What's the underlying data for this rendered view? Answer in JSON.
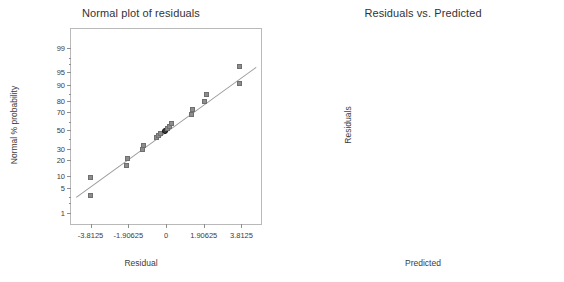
{
  "chart_data": [
    {
      "type": "scatter",
      "id": "normal-plot-of-residuals",
      "title": "Normal plot of residuals",
      "xlabel": "Residual",
      "ylabel": "Normal % probability",
      "grid": false,
      "legend": "none",
      "xlim": [
        -4.8,
        4.8
      ],
      "xticks": [
        "-3.8125",
        "-1.90625",
        "0",
        "1.90625",
        "3.8125"
      ],
      "xtickvals": [
        -3.8125,
        -1.90625,
        0,
        1.90625,
        3.8125
      ],
      "yticks": [
        "99",
        "95",
        "90",
        "80",
        "70",
        "50",
        "30",
        "20",
        "10",
        "5",
        "1"
      ],
      "ytickvals": [
        99,
        95,
        90,
        80,
        70,
        50,
        30,
        20,
        10,
        5,
        1
      ],
      "ylim": [
        0.4,
        99.8
      ],
      "reference_line": {
        "x1": -4.55,
        "y1": 3.0,
        "x2": 4.55,
        "y2": 96.5
      },
      "points": [
        {
          "x": -3.8,
          "y": 9.1,
          "highlight": false
        },
        {
          "x": -3.78,
          "y": 3.2,
          "highlight": false
        },
        {
          "x": -1.95,
          "y": 15.5,
          "highlight": false
        },
        {
          "x": -1.9,
          "y": 21.0,
          "highlight": false
        },
        {
          "x": -1.16,
          "y": 29.0,
          "highlight": false
        },
        {
          "x": -1.1,
          "y": 32.5,
          "highlight": false
        },
        {
          "x": -0.46,
          "y": 41.5,
          "highlight": false
        },
        {
          "x": -0.35,
          "y": 44.0,
          "highlight": false
        },
        {
          "x": -0.27,
          "y": 46.0,
          "highlight": false
        },
        {
          "x": -0.05,
          "y": 49.0,
          "highlight": true
        },
        {
          "x": 0.12,
          "y": 51.5,
          "highlight": false
        },
        {
          "x": 0.22,
          "y": 54.0,
          "highlight": false
        },
        {
          "x": 0.3,
          "y": 57.0,
          "highlight": false
        },
        {
          "x": 1.3,
          "y": 66.5,
          "highlight": false
        },
        {
          "x": 1.35,
          "y": 71.5,
          "highlight": false
        },
        {
          "x": 1.98,
          "y": 79.0,
          "highlight": false
        },
        {
          "x": 2.05,
          "y": 84.0,
          "highlight": false
        },
        {
          "x": 3.72,
          "y": 96.5,
          "highlight": false
        },
        {
          "x": 3.74,
          "y": 90.5,
          "highlight": false
        }
      ]
    },
    {
      "type": "scatter",
      "id": "residuals-vs-predicted",
      "title": "Residuals vs. Predicted",
      "xlabel": "Predicted",
      "ylabel": "Residuals",
      "grid": false,
      "legend": "none",
      "xlim": [
        -9.0,
        60.2
      ],
      "xticks": [
        "-3.81",
        "10.81",
        "25.44",
        "40.06",
        "54.69"
      ],
      "xtickvals": [
        -3.81,
        10.81,
        25.44,
        40.06,
        54.69
      ],
      "yticks": [
        "3.8125",
        "1.90625",
        "0",
        "-1.90625",
        "-3.8125"
      ],
      "ytickvals": [
        3.8125,
        1.90625,
        0,
        -1.90625,
        -3.8125
      ],
      "ylim": [
        -4.65,
        4.62
      ],
      "zero_reference_line": 0,
      "points": [
        {
          "x": -4.3,
          "y": 3.78
        },
        {
          "x": 4.3,
          "y": 3.62
        },
        {
          "x": 0.6,
          "y": 1.94
        },
        {
          "x": 3.2,
          "y": 2.12
        },
        {
          "x": -2.4,
          "y": 1.28
        },
        {
          "x": 51.5,
          "y": 1.36
        },
        {
          "x": 0.9,
          "y": 0.22
        },
        {
          "x": 0.9,
          "y": 0.1
        },
        {
          "x": 0.8,
          "y": -0.22
        },
        {
          "x": 0.9,
          "y": -0.34
        },
        {
          "x": 0.5,
          "y": -1.12
        },
        {
          "x": 49.5,
          "y": -1.18
        },
        {
          "x": 1.9,
          "y": -1.8
        },
        {
          "x": 2.0,
          "y": -1.95
        },
        {
          "x": 2.1,
          "y": -2.02
        },
        {
          "x": 1.5,
          "y": -3.72
        },
        {
          "x": 2.2,
          "y": -3.58
        }
      ]
    }
  ]
}
